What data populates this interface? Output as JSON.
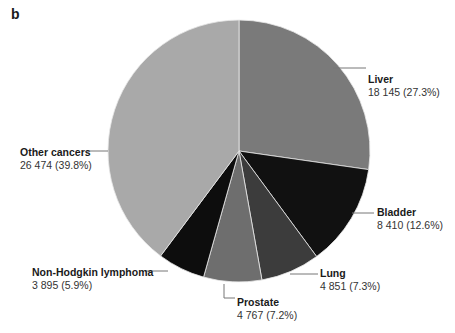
{
  "panel_label": "b",
  "chart_data": {
    "type": "pie",
    "title": "",
    "start_angle_deg": 0,
    "direction": "clockwise",
    "slices": [
      {
        "label": "Liver",
        "value": 18145,
        "value_text": "18 145",
        "percent": 27.3,
        "percent_text": "(27.3%)",
        "color": "#7a7a7a"
      },
      {
        "label": "Bladder",
        "value": 8410,
        "value_text": "8 410",
        "percent": 12.6,
        "percent_text": "(12.6%)",
        "color": "#111111"
      },
      {
        "label": "Lung",
        "value": 4851,
        "value_text": "4 851",
        "percent": 7.3,
        "percent_text": "(7.3%)",
        "color": "#3c3c3c"
      },
      {
        "label": "Prostate",
        "value": 4767,
        "value_text": "4 767",
        "percent": 7.2,
        "percent_text": "(7.2%)",
        "color": "#6e6e6e"
      },
      {
        "label": "Non-Hodgkin lymphoma",
        "value": 3895,
        "value_text": "3 895",
        "percent": 5.9,
        "percent_text": "(5.9%)",
        "color": "#0d0d0d"
      },
      {
        "label": "Other cancers",
        "value": 26474,
        "value_text": "26 474",
        "percent": 39.8,
        "percent_text": "(39.8%)",
        "color": "#a9a9a9"
      }
    ],
    "legend": "none (direct labels with leader lines)"
  }
}
